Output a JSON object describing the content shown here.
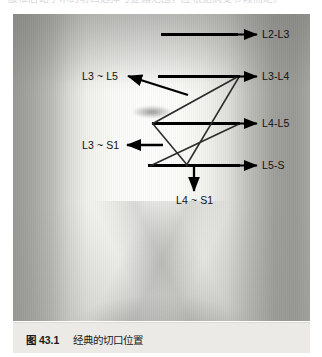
{
  "page": {
    "top_partial_text": "腰椎后路手术的切口选择与显露范围，应根据病变节段而定。"
  },
  "figure": {
    "caption_number": "图 43.1",
    "caption_text": "经典的切口位置",
    "image_alt_name": "clinical-back-photo"
  },
  "labels": {
    "right": [
      {
        "id": "l2-l3",
        "text": "L2-L3"
      },
      {
        "id": "l3-l4",
        "text": "L3-L4"
      },
      {
        "id": "l4-l5",
        "text": "L4-L5"
      },
      {
        "id": "l5-s",
        "text": "L5-S"
      }
    ],
    "left": [
      {
        "id": "l3-l5",
        "text": "L3 ~ L5"
      },
      {
        "id": "l3-s1",
        "text": "L3 ~ S1"
      }
    ],
    "bottom": [
      {
        "id": "l4-s1",
        "text": "L4 ~ S1"
      }
    ]
  },
  "colors": {
    "annotation": "#000000",
    "thin_annotation": "#2a2a2a",
    "caption_bg": "#eceae7",
    "label_text": "#111111"
  }
}
